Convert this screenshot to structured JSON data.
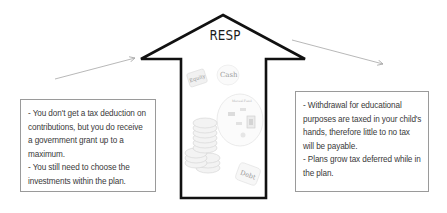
{
  "diagram": {
    "title": "RESP",
    "center_arrow": {
      "direction": "up",
      "stroke_color": "#111111",
      "fill_color": "#ffffff"
    },
    "illustration_labels": {
      "equity": "Equity",
      "cash": "Cash",
      "mutual_fund": "Mutual Fund",
      "debt": "Debt"
    },
    "left_box": {
      "lines": [
        "- You don't get a tax deduction on contributions, but you do receive a government grant up to a maximum.",
        "- You still need to choose the investments within the plan."
      ]
    },
    "right_box": {
      "lines": [
        "- Withdrawal for educational purposes are taxed in your child's hands, therefore little to no tax will be payable.",
        "- Plans grow tax deferred while in the plan."
      ]
    },
    "colors": {
      "text": "#3a3a3a",
      "box_border": "#9a9a9a",
      "pointer_line": "#a8a8a8",
      "illustration": "#cfcfcf"
    }
  }
}
